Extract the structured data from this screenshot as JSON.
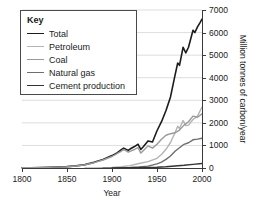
{
  "chart_data": {
    "type": "line",
    "title": "",
    "xlabel": "Year",
    "ylabel": "Million tonnes of carbon/year",
    "xlim": [
      1800,
      2000
    ],
    "ylim": [
      0,
      7000
    ],
    "xticks": [
      1800,
      1850,
      1900,
      1950,
      2000
    ],
    "yticks": [
      0,
      1000,
      2000,
      3000,
      4000,
      5000,
      6000,
      7000
    ],
    "grid": "horizontal",
    "legend_position": "top-left",
    "legend_title": "Key",
    "series": [
      {
        "name": "Total",
        "color": "#1c1c1c",
        "width": 1.6,
        "x": [
          1800,
          1810,
          1820,
          1830,
          1840,
          1850,
          1860,
          1870,
          1880,
          1890,
          1900,
          1905,
          1910,
          1913,
          1918,
          1920,
          1925,
          1929,
          1932,
          1935,
          1940,
          1945,
          1950,
          1955,
          1960,
          1965,
          1970,
          1973,
          1975,
          1979,
          1982,
          1985,
          1990,
          1992,
          1995,
          1998,
          2000
        ],
        "values": [
          8,
          12,
          18,
          27,
          42,
          60,
          95,
          150,
          250,
          380,
          550,
          650,
          800,
          880,
          780,
          840,
          950,
          1050,
          820,
          950,
          1200,
          1150,
          1650,
          2050,
          2550,
          3150,
          4100,
          4650,
          4550,
          5350,
          5100,
          5350,
          6100,
          6000,
          6250,
          6450,
          6600
        ]
      },
      {
        "name": "Petroleum",
        "color": "#b4b4b4",
        "width": 1.4,
        "x": [
          1870,
          1880,
          1890,
          1900,
          1910,
          1920,
          1930,
          1940,
          1950,
          1955,
          1960,
          1965,
          1970,
          1973,
          1975,
          1979,
          1982,
          1985,
          1990,
          1995,
          2000
        ],
        "values": [
          2,
          5,
          12,
          25,
          55,
          105,
          200,
          280,
          430,
          600,
          830,
          1130,
          1560,
          1850,
          1750,
          2100,
          1880,
          1900,
          2150,
          2300,
          2700
        ]
      },
      {
        "name": "Coal",
        "color": "#9a9a9a",
        "width": 1.4,
        "x": [
          1800,
          1820,
          1840,
          1850,
          1860,
          1870,
          1880,
          1890,
          1900,
          1910,
          1913,
          1918,
          1920,
          1925,
          1929,
          1932,
          1935,
          1940,
          1945,
          1950,
          1955,
          1960,
          1965,
          1970,
          1975,
          1980,
          1985,
          1990,
          1995,
          2000
        ],
        "values": [
          8,
          18,
          40,
          57,
          90,
          145,
          235,
          355,
          510,
          740,
          820,
          700,
          740,
          820,
          900,
          660,
          780,
          980,
          880,
          1050,
          1270,
          1450,
          1520,
          1560,
          1680,
          1900,
          2050,
          2300,
          2250,
          2400
        ]
      },
      {
        "name": "Natural gas",
        "color": "#6e6e6e",
        "width": 1.4,
        "x": [
          1890,
          1900,
          1910,
          1920,
          1930,
          1940,
          1950,
          1955,
          1960,
          1965,
          1970,
          1975,
          1980,
          1985,
          1990,
          1995,
          2000
        ],
        "values": [
          2,
          5,
          12,
          25,
          50,
          85,
          180,
          260,
          380,
          530,
          740,
          900,
          1050,
          1120,
          1250,
          1280,
          1320
        ]
      },
      {
        "name": "Cement production",
        "color": "#333333",
        "width": 1.4,
        "x": [
          1900,
          1920,
          1940,
          1950,
          1960,
          1970,
          1980,
          1990,
          2000
        ],
        "values": [
          5,
          12,
          20,
          30,
          55,
          90,
          120,
          160,
          200
        ]
      }
    ]
  }
}
